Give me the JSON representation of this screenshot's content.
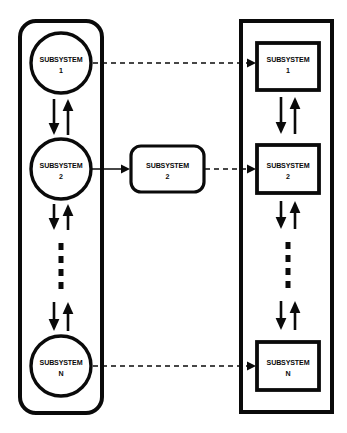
{
  "diagram": {
    "colors": {
      "stroke": "#0a0a0a",
      "fill": "#ffffff",
      "background": "#ffffff"
    },
    "left_group": {
      "shape": "rounded-rectangle",
      "nodes": [
        {
          "id": "left-1",
          "shape": "circle",
          "label": "SUBSYSTEM",
          "index": "1"
        },
        {
          "id": "left-2",
          "shape": "circle",
          "label": "SUBSYSTEM",
          "index": "2"
        },
        {
          "id": "left-n",
          "shape": "circle",
          "label": "SUBSYSTEM",
          "index": "N"
        }
      ],
      "ellipsis": {
        "dots": 4,
        "orientation": "vertical"
      },
      "internal_links": [
        {
          "from": "left-1",
          "to": "left-2",
          "style": "solid",
          "direction": "bidirectional"
        },
        {
          "from": "left-2",
          "to": "ellipsis",
          "style": "solid",
          "direction": "bidirectional"
        },
        {
          "from": "ellipsis",
          "to": "left-n",
          "style": "solid",
          "direction": "bidirectional"
        }
      ]
    },
    "middle_group": {
      "nodes": [
        {
          "id": "middle-2",
          "shape": "rounded-rectangle",
          "label": "SUBSYSTEM",
          "index": "2"
        }
      ]
    },
    "right_group": {
      "shape": "rectangle",
      "nodes": [
        {
          "id": "right-1",
          "shape": "rectangle",
          "label": "SUBSYSTEM",
          "index": "1"
        },
        {
          "id": "right-2",
          "shape": "rectangle",
          "label": "SUBSYSTEM",
          "index": "2"
        },
        {
          "id": "right-n",
          "shape": "rectangle",
          "label": "SUBSYSTEM",
          "index": "N"
        }
      ],
      "ellipsis": {
        "dots": 4,
        "orientation": "vertical"
      },
      "internal_links": [
        {
          "from": "right-1",
          "to": "right-2",
          "style": "solid",
          "direction": "bidirectional"
        },
        {
          "from": "right-2",
          "to": "ellipsis",
          "style": "solid",
          "direction": "bidirectional"
        },
        {
          "from": "ellipsis",
          "to": "right-n",
          "style": "solid",
          "direction": "bidirectional"
        }
      ]
    },
    "cross_links": [
      {
        "from": "left-1",
        "to": "right-1",
        "style": "dashed",
        "direction": "right"
      },
      {
        "from": "left-2",
        "to": "middle-2",
        "style": "solid",
        "direction": "right"
      },
      {
        "from": "middle-2",
        "to": "right-2",
        "style": "dashed",
        "direction": "right"
      },
      {
        "from": "left-n",
        "to": "right-n",
        "style": "dashed",
        "direction": "right"
      }
    ]
  }
}
